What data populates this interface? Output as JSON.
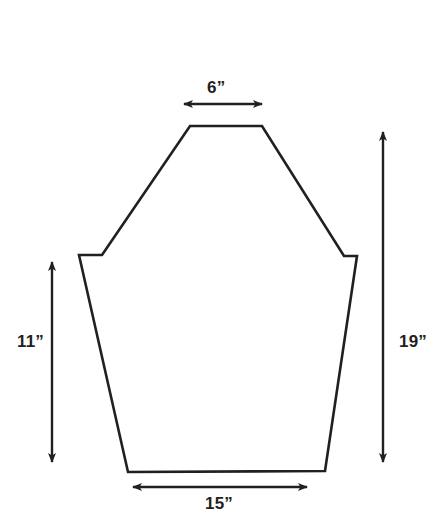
{
  "figure": {
    "type": "geometry-diagram",
    "background_color": "#ffffff",
    "stroke_color": "#231f20",
    "text_color": "#231f20",
    "stroke_width": 2.6,
    "shape": {
      "name": "polygon-outline",
      "vertices": [
        [
          190,
          126
        ],
        [
          262,
          126
        ],
        [
          344,
          256
        ],
        [
          357,
          256
        ],
        [
          325,
          471
        ],
        [
          128,
          472
        ],
        [
          79,
          255
        ],
        [
          102,
          255
        ]
      ]
    },
    "dimensions": [
      {
        "id": "top",
        "label": "6”",
        "value": 6,
        "unit": "inches",
        "orientation": "horizontal",
        "arrow": {
          "x1": 184,
          "y1": 104,
          "x2": 262,
          "y2": 104
        },
        "measures": "top-edge-width"
      },
      {
        "id": "left",
        "label": "11”",
        "value": 11,
        "unit": "inches",
        "orientation": "vertical",
        "arrow": {
          "x1": 52,
          "y1": 262,
          "x2": 52,
          "y2": 462
        },
        "measures": "left-side-height"
      },
      {
        "id": "right",
        "label": "19”",
        "value": 19,
        "unit": "inches",
        "orientation": "vertical",
        "arrow": {
          "x1": 383,
          "y1": 132,
          "x2": 383,
          "y2": 462
        },
        "measures": "overall-height"
      },
      {
        "id": "bottom",
        "label": "15”",
        "value": 15,
        "unit": "inches",
        "orientation": "horizontal",
        "arrow": {
          "x1": 133,
          "y1": 487,
          "x2": 307,
          "y2": 487
        },
        "measures": "bottom-edge-width"
      }
    ]
  }
}
